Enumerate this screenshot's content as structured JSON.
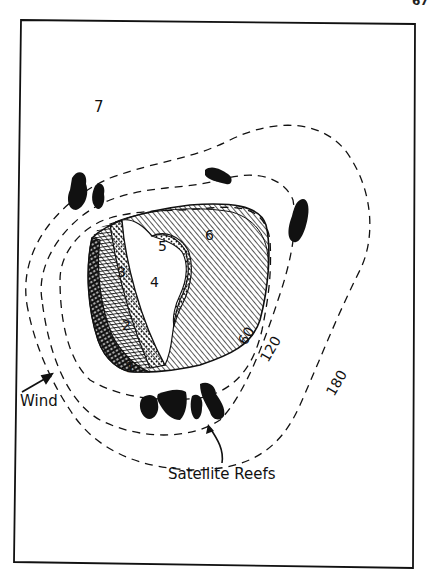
{
  "page": {
    "number_fragment": "67"
  },
  "figure": {
    "zone_labels": [
      {
        "id": "1",
        "text": "1"
      },
      {
        "id": "2",
        "text": "2"
      },
      {
        "id": "3",
        "text": "3"
      },
      {
        "id": "4",
        "text": "4"
      },
      {
        "id": "5",
        "text": "5"
      },
      {
        "id": "6",
        "text": "6"
      },
      {
        "id": "7",
        "text": "7"
      }
    ],
    "contours": [
      {
        "depth": "60",
        "text": "60"
      },
      {
        "depth": "120",
        "text": "120"
      },
      {
        "depth": "180",
        "text": "180"
      }
    ],
    "annotations": {
      "wind": "Wind",
      "satellite_reefs": "Satellite Reefs"
    },
    "colors": {
      "ink": "#111111",
      "paper": "#ffffff"
    }
  }
}
